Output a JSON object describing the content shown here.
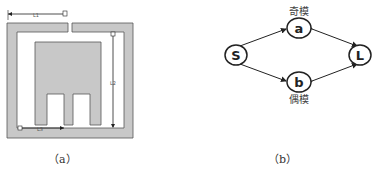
{
  "figure_a": {
    "caption": "（a）",
    "dimensions": {
      "top_label": "L1",
      "right_label": "L2",
      "bottom_label": "L3"
    },
    "colors": {
      "fill": "#c8c8c8",
      "stroke": "#555555",
      "dimension_line": "#222222"
    }
  },
  "figure_b": {
    "caption": "（b）",
    "nodes": {
      "a": {
        "label": "a",
        "annotation": "奇模"
      },
      "b": {
        "label": "b",
        "annotation": "偶模"
      },
      "S": {
        "label": "S"
      },
      "L": {
        "label": "L"
      }
    },
    "edges": [
      {
        "from": "S",
        "to": "a",
        "bidirectional": true
      },
      {
        "from": "a",
        "to": "L",
        "bidirectional": true
      },
      {
        "from": "S",
        "to": "b",
        "bidirectional": true
      },
      {
        "from": "b",
        "to": "L",
        "bidirectional": true
      }
    ]
  }
}
